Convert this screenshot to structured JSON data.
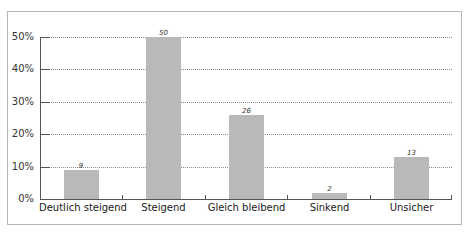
{
  "chart_data": {
    "type": "bar",
    "title": "",
    "xlabel": "",
    "ylabel": "",
    "categories": [
      "Deutlich steigend",
      "Steigend",
      "Gleich bleibend",
      "Sinkend",
      "Unsicher"
    ],
    "values": [
      9,
      50,
      26,
      2,
      13
    ],
    "value_labels": [
      "9",
      "50",
      "26",
      "2",
      "13"
    ],
    "yticks": [
      "0%",
      "10%",
      "20%",
      "30%",
      "40%",
      "50%"
    ],
    "ylim": [
      0,
      50
    ],
    "unit": "%",
    "grid": true,
    "grid_style": "dotted",
    "legend": null,
    "bar_color": "#b9b9b9"
  }
}
